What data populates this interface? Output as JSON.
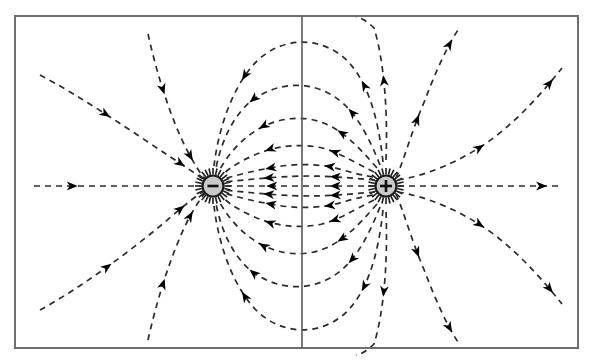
{
  "figure": {
    "background_color": "#ffffff",
    "frame": {
      "name": "figure-border",
      "x": 15,
      "y": 16,
      "width": 563,
      "height": 332,
      "stroke_color": "#6e6e72",
      "stroke_width": 2
    },
    "midline": {
      "name": "perpendicular-bisector",
      "x": 302,
      "y1": 16,
      "y2": 348,
      "stroke_color": "#5b5b60",
      "stroke_width": 1.6
    }
  },
  "style": {
    "line_color": "#2b2b2b",
    "line_width": 1.7,
    "dash_pattern": "6,5",
    "arrow_color": "#000000",
    "arrow_size": 11,
    "charge_fill": "#c9c9c9",
    "charge_stroke": "#1a1a1a",
    "charge_radius": 10.5,
    "charge_stroke_width": 2.2,
    "spike_color": "#1a1a1a"
  },
  "charges": [
    {
      "name": "negative-charge",
      "label": "−",
      "sign": "negative",
      "cx": 213,
      "cy": 186,
      "r": 10.5,
      "fill": "#c9c9c9",
      "stroke": "#1a1a1a"
    },
    {
      "name": "positive-charge",
      "label": "+",
      "sign": "positive",
      "cx": 386,
      "cy": 186,
      "r": 10.5,
      "fill": "#c9c9c9",
      "stroke": "#1a1a1a"
    }
  ],
  "chart_data": {
    "type": "line",
    "xlabel": "",
    "ylabel": "",
    "grid": false,
    "legend": "none",
    "xlim": [
      15,
      578
    ],
    "ylim": [
      16,
      348
    ],
    "annotations": [
      "Negative point charge at (213, 186)",
      "Positive point charge at (386, 186)",
      "Vertical perpendicular bisector at x = 302",
      "Field lines directed from the positive charge toward the negative charge"
    ],
    "series": [
      {
        "name": "inner-arc-1-upper",
        "path": "M 373,177 C 345,172 340,168 326,166 C 310,164 292,164 276,167 C 258,170 240,174 224,179",
        "arrows": [
          {
            "t": 0.33,
            "dir": "left"
          },
          {
            "t": 0.72,
            "dir": "left"
          }
        ]
      },
      {
        "name": "inner-arc-2-upper",
        "path": "M 374,172 C 350,160 338,152 322,148 C 304,144 286,145 268,150 C 250,156 234,164 222,175",
        "arrows": [
          {
            "t": 0.3,
            "dir": "left"
          },
          {
            "t": 0.7,
            "dir": "left"
          }
        ]
      },
      {
        "name": "inner-arc-3-upper",
        "path": "M 377,168 C 358,146 344,132 326,124 C 305,115 283,117 262,127 C 243,137 228,154 219,171",
        "arrows": [
          {
            "t": 0.28,
            "dir": "left"
          },
          {
            "t": 0.7,
            "dir": "left"
          }
        ]
      },
      {
        "name": "inner-arc-4-upper",
        "path": "M 380,165 C 366,130 352,106 330,94 C 306,81 280,83 257,97 C 236,110 222,138 216,168",
        "arrows": [
          {
            "t": 0.26,
            "dir": "left"
          },
          {
            "t": 0.7,
            "dir": "left"
          }
        ]
      },
      {
        "name": "inner-arc-5-upper",
        "path": "M 383,162 C 378,114 366,76 342,56 C 316,36 282,38 258,60 C 235,82 219,124 214,166",
        "arrows": [
          {
            "t": 0.26,
            "dir": "left"
          },
          {
            "t": 0.72,
            "dir": "left"
          }
        ]
      },
      {
        "name": "inner-arc-6-upper",
        "path": "M 386,160 C 388,112 384,60 374,28 C 368,22 362,18 356,17",
        "arrows": [
          {
            "t": 0.55,
            "dir": "up"
          }
        ]
      },
      {
        "name": "inner-line-1-upper",
        "path": "M 375,180 C 350,178 330,176 310,176 C 288,176 262,178 224,182",
        "arrows": [
          {
            "t": 0.3,
            "dir": "left"
          },
          {
            "t": 0.74,
            "dir": "left"
          }
        ]
      },
      {
        "name": "axis-between-charges",
        "path": "M 375,186 L 224,186",
        "arrows": [
          {
            "t": 0.3,
            "dir": "left"
          },
          {
            "t": 0.72,
            "dir": "left"
          }
        ]
      },
      {
        "name": "inner-line-1-lower",
        "path": "M 375,192 C 350,194 330,196 310,196 C 288,196 262,194 224,190",
        "arrows": [
          {
            "t": 0.3,
            "dir": "left"
          },
          {
            "t": 0.74,
            "dir": "left"
          }
        ]
      },
      {
        "name": "inner-arc-1-lower",
        "path": "M 373,195 C 345,200 340,204 326,206 C 310,208 292,208 276,205 C 258,202 240,198 224,193",
        "arrows": [
          {
            "t": 0.33,
            "dir": "left"
          },
          {
            "t": 0.72,
            "dir": "left"
          }
        ]
      },
      {
        "name": "inner-arc-2-lower",
        "path": "M 374,200 C 350,212 338,220 322,224 C 304,228 286,227 268,222 C 250,216 234,208 222,197",
        "arrows": [
          {
            "t": 0.3,
            "dir": "left"
          },
          {
            "t": 0.7,
            "dir": "left"
          }
        ]
      },
      {
        "name": "inner-arc-3-lower",
        "path": "M 377,204 C 358,226 344,240 326,248 C 305,257 283,255 262,245 C 243,235 228,218 219,201",
        "arrows": [
          {
            "t": 0.28,
            "dir": "left"
          },
          {
            "t": 0.7,
            "dir": "left"
          }
        ]
      },
      {
        "name": "inner-arc-4-lower",
        "path": "M 380,207 C 366,242 352,266 330,278 C 306,291 280,289 257,275 C 236,262 222,234 216,204",
        "arrows": [
          {
            "t": 0.26,
            "dir": "left"
          },
          {
            "t": 0.7,
            "dir": "left"
          }
        ]
      },
      {
        "name": "inner-arc-5-lower",
        "path": "M 383,210 C 378,258 366,296 342,316 C 316,336 282,334 258,312 C 235,290 219,248 214,206",
        "arrows": [
          {
            "t": 0.26,
            "dir": "left"
          },
          {
            "t": 0.72,
            "dir": "left"
          }
        ]
      },
      {
        "name": "inner-arc-6-lower",
        "path": "M 386,212 C 388,260 384,312 374,344 C 368,350 362,354 356,355",
        "arrows": [
          {
            "t": 0.55,
            "dir": "down"
          }
        ]
      },
      {
        "name": "outer-left-horizontal",
        "path": "M 34,186 L 202,186",
        "arrows": [
          {
            "t": 0.26,
            "dir": "right"
          }
        ]
      },
      {
        "name": "outer-left-upper-1",
        "path": "M 40,75 C 80,96 130,130 172,158 C 186,167 196,174 204,180",
        "arrows": [
          {
            "t": 0.42,
            "dir": "right-down"
          },
          {
            "t": 0.88,
            "dir": "right-down"
          }
        ]
      },
      {
        "name": "outer-left-upper-2",
        "path": "M 148,34 C 156,70 170,118 188,152 C 195,165 200,173 205,179",
        "arrows": [
          {
            "t": 0.4,
            "dir": "down"
          },
          {
            "t": 0.86,
            "dir": "down-right"
          }
        ]
      },
      {
        "name": "outer-left-lower-1",
        "path": "M 40,310 C 80,288 130,252 172,216 C 186,204 196,196 204,191",
        "arrows": [
          {
            "t": 0.42,
            "dir": "right-up"
          },
          {
            "t": 0.88,
            "dir": "right-up"
          }
        ]
      },
      {
        "name": "outer-left-lower-2",
        "path": "M 148,340 C 156,304 170,256 188,220 C 195,207 200,199 205,193",
        "arrows": [
          {
            "t": 0.4,
            "dir": "up"
          },
          {
            "t": 0.86,
            "dir": "up-right"
          }
        ]
      },
      {
        "name": "outer-right-horizontal",
        "path": "M 398,186 L 560,186",
        "arrows": [
          {
            "t": 0.92,
            "dir": "right"
          }
        ]
      },
      {
        "name": "outer-right-upper-1",
        "path": "M 396,178 C 404,160 412,130 425,100 C 434,76 446,48 458,30",
        "arrows": [
          {
            "t": 0.42,
            "dir": "up"
          },
          {
            "t": 0.93,
            "dir": "up"
          }
        ]
      },
      {
        "name": "outer-right-upper-2",
        "path": "M 398,180 C 424,176 462,162 496,136 C 524,114 546,88 562,68",
        "arrows": [
          {
            "t": 0.46,
            "dir": "right-up"
          },
          {
            "t": 0.93,
            "dir": "right-up"
          }
        ]
      },
      {
        "name": "outer-right-lower-1",
        "path": "M 396,194 C 404,212 412,242 425,272 C 434,296 446,324 458,342",
        "arrows": [
          {
            "t": 0.42,
            "dir": "down"
          },
          {
            "t": 0.93,
            "dir": "down"
          }
        ]
      },
      {
        "name": "outer-right-lower-2",
        "path": "M 398,192 C 424,196 462,210 496,236 C 524,258 546,284 562,304",
        "arrows": [
          {
            "t": 0.46,
            "dir": "right-down"
          },
          {
            "t": 0.93,
            "dir": "right-down"
          }
        ]
      }
    ],
    "spikes": {
      "negative": {
        "count": 28,
        "r_inner": 11.5,
        "r_outer": 18,
        "center": [
          213,
          186
        ]
      },
      "positive": {
        "count": 28,
        "r_inner": 11.5,
        "r_outer": 18,
        "center": [
          386,
          186
        ]
      }
    }
  }
}
